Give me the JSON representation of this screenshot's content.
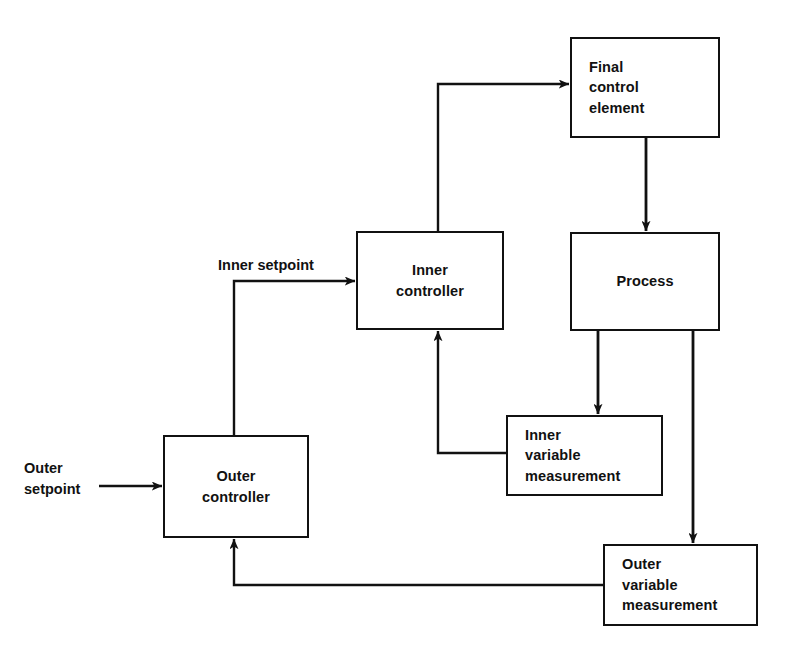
{
  "diagram": {
    "stroke_color": "#111111",
    "background_color": "#ffffff",
    "nodes": [
      {
        "id": "final-control-element",
        "label": "Final\ncontrol\nelement",
        "x": 570,
        "y": 37,
        "width": 150,
        "height": 101,
        "align": "left"
      },
      {
        "id": "process",
        "label": "Process",
        "x": 570,
        "y": 232,
        "width": 150,
        "height": 99,
        "align": "center"
      },
      {
        "id": "inner-controller",
        "label": "Inner\ncontroller",
        "x": 356,
        "y": 231,
        "width": 148,
        "height": 99,
        "align": "center"
      },
      {
        "id": "outer-controller",
        "label": "Outer\ncontroller",
        "x": 163,
        "y": 435,
        "width": 146,
        "height": 103,
        "align": "center"
      },
      {
        "id": "inner-variable-measurement",
        "label": "Inner\nvariable\nmeasurement",
        "x": 506,
        "y": 415,
        "width": 157,
        "height": 81,
        "align": "left"
      },
      {
        "id": "outer-variable-measurement",
        "label": "Outer\nvariable\nmeasurement",
        "x": 603,
        "y": 544,
        "width": 155,
        "height": 82,
        "align": "left"
      }
    ],
    "edge_labels": [
      {
        "id": "outer-setpoint-label",
        "text": "Outer\nsetpoint",
        "x": 24,
        "y": 458
      },
      {
        "id": "inner-setpoint-label",
        "text": "Inner setpoint",
        "x": 218,
        "y": 255
      }
    ],
    "connections": [
      {
        "id": "outer-setpoint-to-outer-controller",
        "from": "outer-setpoint",
        "to": "outer-controller",
        "arrow": true
      },
      {
        "id": "outer-controller-to-inner-controller",
        "from": "outer-controller",
        "to": "inner-controller",
        "arrow": true
      },
      {
        "id": "inner-controller-to-final-control-element",
        "from": "inner-controller",
        "to": "final-control-element",
        "arrow": true
      },
      {
        "id": "final-control-element-to-process",
        "from": "final-control-element",
        "to": "process",
        "arrow": true
      },
      {
        "id": "process-to-inner-variable-measurement",
        "from": "process",
        "to": "inner-variable-measurement",
        "arrow": true
      },
      {
        "id": "process-to-outer-variable-measurement",
        "from": "process",
        "to": "outer-variable-measurement",
        "arrow": true
      },
      {
        "id": "inner-variable-measurement-to-inner-controller",
        "from": "inner-variable-measurement",
        "to": "inner-controller",
        "arrow": true
      },
      {
        "id": "outer-variable-measurement-to-outer-controller",
        "from": "outer-variable-measurement",
        "to": "outer-controller",
        "arrow": true
      }
    ]
  }
}
